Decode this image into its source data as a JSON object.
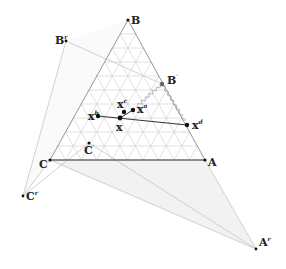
{
  "figure": {
    "type": "ternary-simplex-diagram",
    "colors": {
      "grid": "#c8c8c8",
      "triangle_edge": "#8a8a8a",
      "outer_edge": "#b5b5b5",
      "shade": "#ececec",
      "point": "#111111",
      "segment": "#333333",
      "wavy": "#9a9a9a"
    },
    "grid_divisions": 10,
    "vertices": {
      "A": {
        "label": "A",
        "sup": "",
        "x": 205,
        "y": 160
      },
      "B": {
        "label": "B",
        "sup": "",
        "x": 128,
        "y": 20
      },
      "C": {
        "label": "C",
        "sup": "",
        "x": 50,
        "y": 160
      }
    },
    "reflected_vertices": {
      "Ar": {
        "label": "A",
        "sup": "r",
        "x": 256,
        "y": 249
      },
      "Br": {
        "label": "B",
        "sup": "r",
        "x": 66,
        "y": 41
      },
      "Cr": {
        "label": "C",
        "sup": "r",
        "x": 23,
        "y": 196
      }
    },
    "other_points": {
      "Bprime": {
        "label": "B",
        "sup": "′",
        "x": 162,
        "y": 84
      },
      "Cprime": {
        "label": "C",
        "sup": "′",
        "x": 89,
        "y": 143
      }
    },
    "x_points": {
      "x": {
        "label": "x",
        "sup": "",
        "x": 120,
        "y": 118
      },
      "xa": {
        "label": "x",
        "sup": "a",
        "x": 133,
        "y": 110
      },
      "xb": {
        "label": "x",
        "sup": "b",
        "x": 98,
        "y": 116
      },
      "xc": {
        "label": "x",
        "sup": "c",
        "x": 124,
        "y": 112
      },
      "xd": {
        "label": "x",
        "sup": "d",
        "x": 187,
        "y": 125
      }
    }
  }
}
